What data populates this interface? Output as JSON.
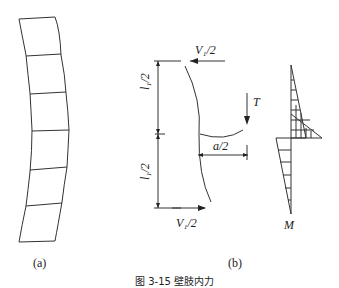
{
  "figure": {
    "panel_a": {
      "label": "(a)"
    },
    "panel_b": {
      "label": "(b)",
      "top_force": "V₁/2",
      "bottom_force": "V₁/2",
      "upper_length": "l₁/2",
      "lower_length": "l₁/2",
      "tension": "T",
      "offset": "a/2",
      "moment": "M"
    },
    "caption": "图 3-15 壁肢内力"
  }
}
